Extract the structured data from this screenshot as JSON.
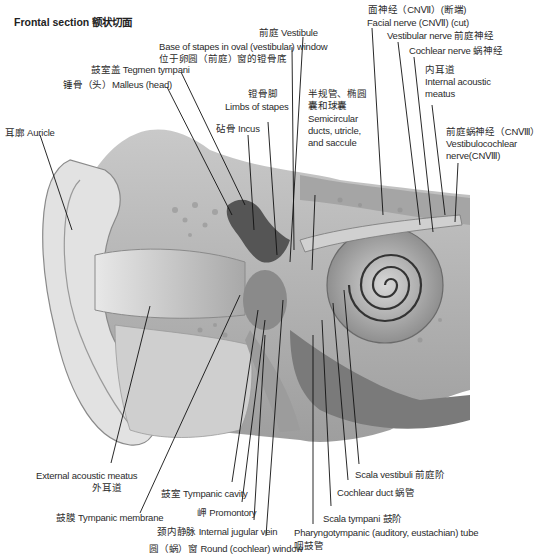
{
  "title": "Frontal section 额状切面",
  "colors": {
    "background": "#ffffff",
    "illustration_light": "#e6e6e6",
    "illustration_mid": "#b8b8b8",
    "illustration_dark": "#5a5a5a",
    "leader_line": "#111111",
    "text": "#2b2b2b"
  },
  "labels": {
    "vestibule": "前庭 Vestibule",
    "base_of_stapes_en": "Base of stapes in oval (vestibular) window",
    "base_of_stapes_zh": "位于卵圆（前庭）窗的镫骨底",
    "tegmen_tympani": "鼓室盖 Tegmen tympani",
    "malleus_head": "锤骨（头）Malleus (head)",
    "auricle": "耳廓 Auricle",
    "incus": "砧骨 Incus",
    "limbs_of_stapes_zh": "镫骨脚",
    "limbs_of_stapes_en": "Limbs of stapes",
    "semicircular_zh_1": "半规管、椭圆",
    "semicircular_zh_2": "囊和球囊",
    "semicircular_en_1": "Semicircular",
    "semicircular_en_2": "ducts, utricle,",
    "semicircular_en_3": "and saccule",
    "facial_nerve_zh": "面神经（CNⅦ）(断端)",
    "facial_nerve_en": "Facial nerve (CNⅦ) (cut)",
    "vestibular_nerve": "Vestibular nerve 前庭神经",
    "cochlear_nerve": "Cochlear nerve 蜗神经",
    "internal_acoustic_zh": "内耳道",
    "internal_acoustic_en_1": "Internal acoustic",
    "internal_acoustic_en_2": "meatus",
    "vestibulocochlear_zh": "前庭蜗神经（CNⅧ）",
    "vestibulocochlear_en_1": "Vestibulocochlear",
    "vestibulocochlear_en_2": "nerve(CNⅧ)",
    "external_acoustic_en": "External acoustic meatus",
    "external_acoustic_zh": "外耳道",
    "tympanic_membrane": "鼓膜 Tympanic membrane",
    "tympanic_cavity": "鼓室 Tympanic cavity",
    "promontory": "岬 Promontory",
    "internal_jugular_vein": "颈内静脉 Internal jugular vein",
    "round_window": "圆（蜗）窗 Round (cochlear) window",
    "scala_vestibuli": "Scala vestibuli 前庭阶",
    "cochlear_duct": "Cochlear duct 蜗管",
    "scala_tympani": "Scala tympani 鼓阶",
    "pharyngotympanic_en": "Pharyngotympanic (auditory, eustachian) tube",
    "pharyngotympanic_zh": "咽鼓管"
  }
}
